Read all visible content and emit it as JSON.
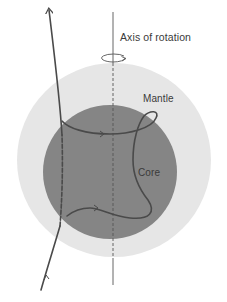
{
  "diagram": {
    "title_partial": "",
    "labels": {
      "axis": "Axis of rotation",
      "mantle": "Mantle",
      "core": "Core"
    },
    "colors": {
      "background": "#ffffff",
      "mantle": "#e6e6e6",
      "core": "#858585",
      "ray": "#4a4a4a",
      "axis": "#555555",
      "text": "#3a3a3a"
    },
    "components": [
      {
        "name": "mantle",
        "shape": "circle",
        "center": [
          114,
          160
        ],
        "radius": 97
      },
      {
        "name": "core",
        "shape": "circle",
        "center": [
          110,
          172
        ],
        "radius": 67
      },
      {
        "name": "axis-of-rotation",
        "shape": "vertical line",
        "x": 113,
        "y_range": [
          12,
          284
        ],
        "style_inside_sphere": "dashed"
      },
      {
        "name": "rotation-indicator",
        "shape": "ellipse arrow",
        "center": [
          113,
          57
        ]
      },
      {
        "name": "seismic-ray",
        "shape": "curved path with arrows",
        "direction": "bottom-left upward to top-left"
      }
    ]
  }
}
